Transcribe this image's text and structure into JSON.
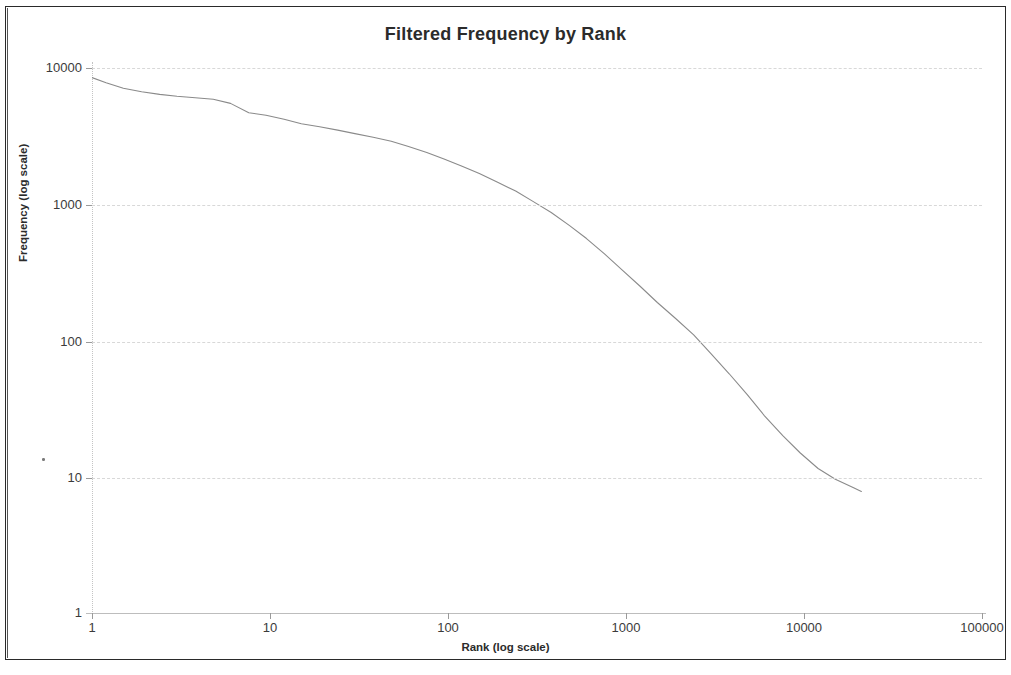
{
  "chart_data": {
    "type": "line",
    "title": "Filtered Frequency by Rank",
    "xlabel": "Rank (log scale)",
    "ylabel": "Frequency (log scale)",
    "xscale": "log",
    "yscale": "log",
    "xlim": [
      1,
      100000
    ],
    "ylim": [
      1,
      10000
    ],
    "grid": true,
    "grid_axis": "y",
    "legend": "none",
    "xticks": [
      "1",
      "10",
      "100",
      "1000",
      "10000",
      "100000"
    ],
    "xtick_values": [
      1,
      10,
      100,
      1000,
      10000,
      100000
    ],
    "yticks": [
      "1",
      "10",
      "100",
      "1000",
      "10000"
    ],
    "ytick_values": [
      1,
      10,
      100,
      1000,
      10000
    ],
    "series": [
      {
        "name": "Filtered frequency",
        "color": "#8a8a8a",
        "x": [
          1,
          1.2,
          1.5,
          1.9,
          2.4,
          3,
          3.8,
          4.8,
          6,
          7.6,
          9.5,
          12,
          15,
          19,
          24,
          30,
          38,
          48,
          60,
          76,
          95,
          120,
          150,
          190,
          240,
          300,
          380,
          480,
          600,
          760,
          950,
          1200,
          1500,
          1900,
          2400,
          3000,
          3800,
          4800,
          6000,
          7600,
          9500,
          12000,
          15000,
          19000,
          21000
        ],
        "y": [
          8500,
          7800,
          7100,
          6700,
          6400,
          6200,
          6050,
          5900,
          5500,
          4700,
          4500,
          4200,
          3900,
          3700,
          3500,
          3300,
          3100,
          2900,
          2650,
          2400,
          2150,
          1900,
          1680,
          1450,
          1250,
          1050,
          870,
          700,
          560,
          430,
          330,
          250,
          190,
          145,
          110,
          80,
          57,
          40,
          28,
          20,
          15,
          11.5,
          9.6,
          8.3,
          7.8
        ]
      }
    ]
  },
  "axes": {
    "title": "Filtered Frequency by Rank",
    "x_axis_title": "Rank (log scale)",
    "y_axis_title": "Frequency (log scale)"
  }
}
